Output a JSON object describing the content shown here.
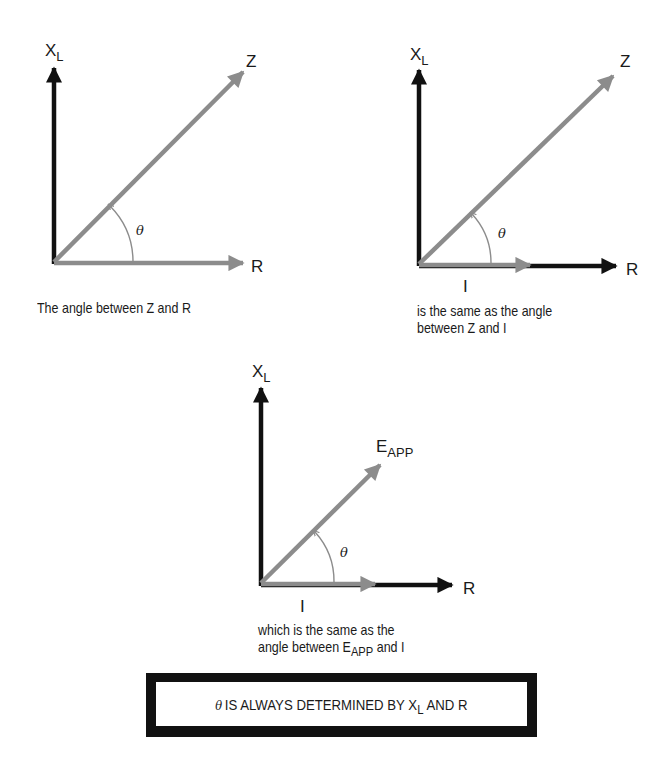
{
  "colors": {
    "reactance_vector": "#111111",
    "gray_vector": "#8c8c8c",
    "angle_arc": "#8c8c8c",
    "text": "#1a1a1a"
  },
  "panel1": {
    "xl_label": "X",
    "xl_sub": "L",
    "z_label": "Z",
    "r_label": "R",
    "theta": "θ",
    "caption": "The angle between Z and R"
  },
  "panel2": {
    "xl_label": "X",
    "xl_sub": "L",
    "z_label": "Z",
    "r_label": "R",
    "i_label": "I",
    "theta": "θ",
    "caption_line1": "is the same as the angle",
    "caption_line2": "between Z and I"
  },
  "panel3": {
    "xl_label": "X",
    "xl_sub": "L",
    "e_label": "E",
    "e_sub": "APP",
    "r_label": "R",
    "i_label": "I",
    "theta": "θ",
    "caption_line1": "which is the same as the",
    "caption_line2_a": "angle between E",
    "caption_line2_sub": "APP",
    "caption_line2_b": " and I"
  },
  "note": {
    "theta": "θ",
    "text_a": "IS ALWAYS DETERMINED BY X",
    "text_sub": "L",
    "text_b": " AND R"
  }
}
